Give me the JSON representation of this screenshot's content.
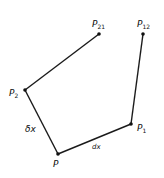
{
  "diagram": {
    "type": "geometric-construction",
    "colors": {
      "line": "#1a1a1a",
      "background": "#ffffff"
    },
    "points": [
      {
        "id": "P",
        "label": "P",
        "sub": "",
        "x": 58,
        "y": 154
      },
      {
        "id": "P1",
        "label": "P",
        "sub": "1",
        "x": 131,
        "y": 124
      },
      {
        "id": "P2",
        "label": "P",
        "sub": "2",
        "x": 25,
        "y": 90
      },
      {
        "id": "P12",
        "label": "P",
        "sub": "12",
        "x": 143,
        "y": 34
      },
      {
        "id": "P21",
        "label": "P",
        "sub": "21",
        "x": 99,
        "y": 34
      }
    ],
    "edges": [
      {
        "from": "P",
        "to": "P1",
        "label": "dx"
      },
      {
        "from": "P",
        "to": "P2",
        "label": "δx"
      },
      {
        "from": "P1",
        "to": "P12",
        "label": ""
      },
      {
        "from": "P2",
        "to": "P21",
        "label": ""
      }
    ],
    "edge_labels": {
      "dx": "dx",
      "deltax": "δx"
    }
  }
}
